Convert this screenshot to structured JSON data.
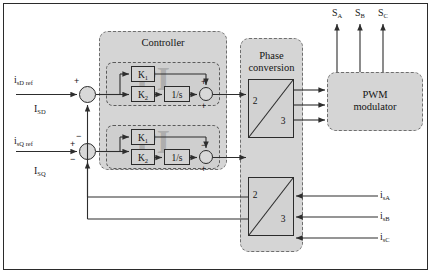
{
  "diagram": {
    "frame_color": "#2b2b2b",
    "panel_fill": "#d5d5d5",
    "line_color": "#2d2d2d"
  },
  "inputs": {
    "ref_d": "i",
    "ref_d_sub": "sD ref",
    "ref_q": "i",
    "ref_q_sub": "sQ ref",
    "fb_d": "I",
    "fb_d_sub": "SD",
    "fb_q": "I",
    "fb_q_sub": "SQ"
  },
  "controller": {
    "title": "Controller",
    "watermark": "PI",
    "loops": [
      {
        "name": "d-axis",
        "gain_p": "K",
        "gain_p_sub": "1",
        "gain_i": "K",
        "gain_i_sub": "2",
        "integrator": "1/s",
        "sum_top_sign": "+",
        "sum_bottom_sign": "+"
      },
      {
        "name": "q-axis",
        "gain_p": "K",
        "gain_p_sub": "1",
        "gain_i": "K",
        "gain_i_sub": "2",
        "integrator": "1/s",
        "sum_top_sign": "−",
        "sum_bottom_sign": "+"
      }
    ]
  },
  "phase_conversion": {
    "title_line1": "Phase",
    "title_line2": "conversion",
    "forward_block": {
      "from": "2",
      "to": "3"
    },
    "feedback_block": {
      "from": "2",
      "to": "3"
    }
  },
  "pwm": {
    "title_line1": "PWM",
    "title_line2": "modulator"
  },
  "outputs": {
    "switch_a": "S",
    "switch_a_sub": "A",
    "switch_b": "S",
    "switch_b_sub": "B",
    "switch_c": "S",
    "switch_c_sub": "C"
  },
  "measured_currents": {
    "phase_a": "i",
    "phase_a_sub": "sA",
    "phase_b": "i",
    "phase_b_sub": "sB",
    "phase_c": "i",
    "phase_c_sub": "sC"
  },
  "summing_junctions": {
    "d_input": {
      "plus": "+",
      "minus": ""
    },
    "q_input": {
      "plus": "+",
      "minus": "−",
      "extra_minus": "−"
    }
  }
}
